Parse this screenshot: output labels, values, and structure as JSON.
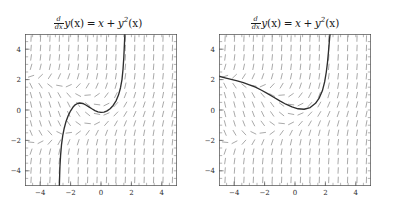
{
  "figure": {
    "width": 393,
    "height": 211,
    "background": "#ffffff",
    "panel_count": 2
  },
  "panels": [
    {
      "id": "left",
      "title_text": "d/dx y(x) = x + y^2(x)",
      "title_parts": {
        "frac_num": "d",
        "frac_den": "dx",
        "lhs_fn": "y",
        "lhs_arg": "(x)",
        "equals": "=",
        "term1": "x",
        "plus": "+",
        "term2_fn": "y",
        "term2_pow": "2",
        "term2_arg": "(x)"
      }
    },
    {
      "id": "right",
      "title_text": "d/dx y(x) = x + y^2(x)",
      "title_parts": {
        "frac_num": "d",
        "frac_den": "dx",
        "lhs_fn": "y",
        "lhs_arg": "(x)",
        "equals": "=",
        "term1": "x",
        "plus": "+",
        "term2_fn": "y",
        "term2_pow": "2",
        "term2_arg": "(x)"
      }
    }
  ],
  "chart_data": [
    {
      "type": "line",
      "panel": "left",
      "title": "d/dx y(x) = x + y^2(x)",
      "xlabel": "",
      "ylabel": "",
      "xlim": [
        -5,
        5
      ],
      "ylim": [
        -5,
        5
      ],
      "grid": false,
      "legend": null,
      "xticks": [
        -4,
        -2,
        0,
        2,
        4
      ],
      "yticks": [
        -4,
        -2,
        0,
        2,
        4
      ],
      "xticklabels": [
        "-4",
        "-2",
        "0",
        "2",
        "4"
      ],
      "yticklabels": [
        "-4",
        "-2",
        "0",
        "2",
        "4"
      ],
      "minor_tick_step": 0.5,
      "slope_field": {
        "equation": "dy/dx = x + y^2",
        "x_start": -4.6,
        "x_step": 0.62,
        "y_start": -4.6,
        "y_step": 0.62,
        "segment_length": 0.42,
        "color": "#8c8c8c"
      },
      "series": [
        {
          "name": "solution curve",
          "color": "#2e2e2e",
          "x": [
            -2.74,
            -2.72,
            -2.7,
            -2.66,
            -2.6,
            -2.52,
            -2.42,
            -2.3,
            -2.16,
            -2.0,
            -1.85,
            -1.7,
            -1.55,
            -1.4,
            -1.2,
            -1.0,
            -0.8,
            -0.6,
            -0.4,
            -0.2,
            0.0,
            0.2,
            0.4,
            0.6,
            0.8,
            1.0,
            1.15,
            1.28,
            1.38,
            1.45,
            1.5,
            1.54,
            1.57
          ],
          "y": [
            -5.0,
            -4.3,
            -3.7,
            -3.0,
            -2.3,
            -1.7,
            -1.2,
            -0.75,
            -0.38,
            -0.05,
            0.18,
            0.34,
            0.43,
            0.46,
            0.43,
            0.33,
            0.21,
            0.08,
            -0.04,
            -0.12,
            -0.16,
            -0.14,
            -0.06,
            0.08,
            0.3,
            0.62,
            0.98,
            1.45,
            2.0,
            2.7,
            3.45,
            4.3,
            5.0
          ]
        }
      ]
    },
    {
      "type": "line",
      "panel": "right",
      "title": "d/dx y(x) = x + y^2(x)",
      "xlabel": "",
      "ylabel": "",
      "xlim": [
        -5,
        5
      ],
      "ylim": [
        -5,
        5
      ],
      "grid": false,
      "legend": null,
      "xticks": [
        -4,
        -2,
        0,
        2,
        4
      ],
      "yticks": [
        -4,
        -2,
        0,
        2,
        4
      ],
      "xticklabels": [
        "-4",
        "-2",
        "0",
        "2",
        "4"
      ],
      "yticklabels": [
        "-4",
        "-2",
        "0",
        "2",
        "4"
      ],
      "minor_tick_step": 0.5,
      "slope_field": {
        "equation": "dy/dx = x + y^2",
        "x_start": -4.6,
        "x_step": 0.62,
        "y_start": -4.6,
        "y_step": 0.62,
        "segment_length": 0.42,
        "color": "#8c8c8c"
      },
      "series": [
        {
          "name": "solution curve",
          "color": "#2e2e2e",
          "x": [
            -5.0,
            -4.6,
            -4.2,
            -3.8,
            -3.4,
            -3.0,
            -2.6,
            -2.2,
            -1.8,
            -1.4,
            -1.0,
            -0.6,
            -0.2,
            0.2,
            0.6,
            1.0,
            1.35,
            1.6,
            1.8,
            1.95,
            2.06,
            2.14,
            2.2,
            2.25,
            2.28,
            2.31
          ],
          "y": [
            2.22,
            2.12,
            2.02,
            1.92,
            1.8,
            1.66,
            1.5,
            1.3,
            1.08,
            0.84,
            0.6,
            0.38,
            0.2,
            0.08,
            0.05,
            0.16,
            0.44,
            0.8,
            1.26,
            1.85,
            2.5,
            3.15,
            3.8,
            4.4,
            4.75,
            5.0
          ]
        }
      ]
    }
  ]
}
